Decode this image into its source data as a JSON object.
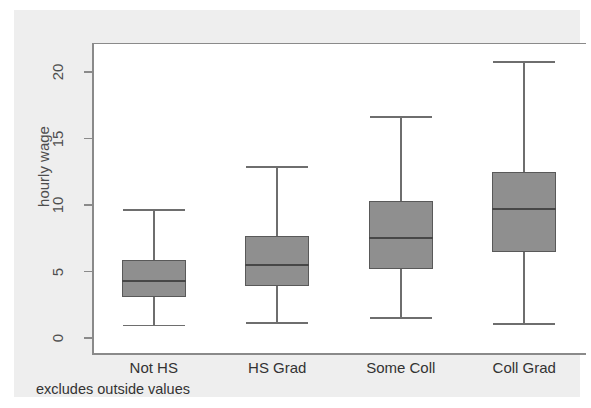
{
  "chart_data": {
    "type": "box",
    "title": "",
    "subtitle": "",
    "xlabel": "",
    "ylabel": "hourly wage",
    "note": "excludes outside values",
    "ylim": [
      0,
      22
    ],
    "yticks": [
      0,
      5,
      10,
      15,
      20
    ],
    "ytick_labels": [
      "0",
      "5",
      "10",
      "15",
      "20"
    ],
    "grid": false,
    "legend": "none",
    "categories": [
      "Not HS",
      "HS Grad",
      "Some Coll",
      "Coll Grad"
    ],
    "boxes": [
      {
        "category": "Not HS",
        "whisker_low": 1.0,
        "q1": 3.1,
        "median": 4.3,
        "q3": 5.9,
        "whisker_high": 9.7
      },
      {
        "category": "HS Grad",
        "whisker_low": 1.2,
        "q1": 3.9,
        "median": 5.5,
        "q3": 7.7,
        "whisker_high": 12.9
      },
      {
        "category": "Some Coll",
        "whisker_low": 1.6,
        "q1": 5.2,
        "median": 7.5,
        "q3": 10.3,
        "whisker_high": 16.7
      },
      {
        "category": "Coll Grad",
        "whisker_low": 1.1,
        "q1": 6.5,
        "median": 9.7,
        "q3": 12.5,
        "whisker_high": 20.8
      }
    ],
    "colors": {
      "box_fill": "#8f8f8f",
      "box_border": "#595959",
      "median": "#474747",
      "whisker": "#6e6e6e",
      "axis": "#8a8a8a",
      "plot_background": "#ffffff",
      "graph_background": "#eeeeee",
      "text": "#333333"
    }
  }
}
